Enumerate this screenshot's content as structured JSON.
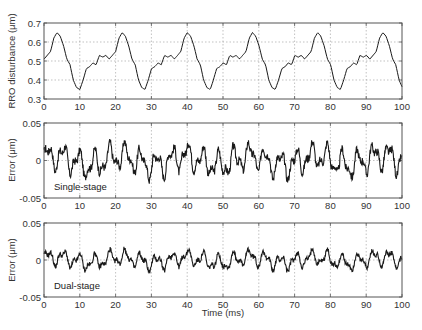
{
  "chart_data": [
    {
      "type": "line",
      "title": "",
      "xlabel": "",
      "ylabel": "RRO disturbance (μm)",
      "xlim": [
        0,
        100
      ],
      "ylim": [
        0.3,
        0.7
      ],
      "xticks": [
        "0",
        "10",
        "20",
        "30",
        "40",
        "50",
        "60",
        "70",
        "80",
        "90",
        "100"
      ],
      "yticks": [
        "0.3",
        "0.4",
        "0.5",
        "0.6",
        "0.7"
      ],
      "grid": true,
      "period_ms": 18.2,
      "series": [
        {
          "name": "RRO disturbance",
          "x": [
            0,
            1,
            2,
            3,
            4,
            5,
            6,
            7,
            8,
            9,
            10,
            11,
            12,
            13,
            14,
            15,
            16,
            17,
            18,
            19,
            20
          ],
          "values": [
            0.51,
            0.53,
            0.55,
            0.62,
            0.65,
            0.63,
            0.58,
            0.51,
            0.48,
            0.4,
            0.36,
            0.35,
            0.4,
            0.46,
            0.47,
            0.49,
            0.48,
            0.53,
            0.52,
            0.53,
            0.55
          ]
        }
      ]
    },
    {
      "type": "line",
      "title": "",
      "xlabel": "",
      "ylabel": "Error (μm)",
      "xlim": [
        0,
        100
      ],
      "ylim": [
        -0.05,
        0.05
      ],
      "xticks": [
        "0",
        "10",
        "20",
        "30",
        "40",
        "50",
        "60",
        "70",
        "80",
        "90",
        "100"
      ],
      "yticks": [
        "-0.05",
        "0",
        "0.05"
      ],
      "grid": true,
      "annotation": "Single-stage",
      "series": [
        {
          "name": "Single-stage error",
          "amplitude_approx": 0.025,
          "range": [
            -0.022,
            0.027
          ]
        }
      ]
    },
    {
      "type": "line",
      "title": "",
      "xlabel": "Time (ms)",
      "ylabel": "Error (μm)",
      "xlim": [
        0,
        100
      ],
      "ylim": [
        -0.05,
        0.05
      ],
      "xticks": [
        "0",
        "10",
        "20",
        "30",
        "40",
        "50",
        "60",
        "70",
        "80",
        "90",
        "100"
      ],
      "yticks": [
        "-0.05",
        "0",
        "0.05"
      ],
      "grid": true,
      "annotation": "Dual-stage",
      "series": [
        {
          "name": "Dual-stage error",
          "amplitude_approx": 0.015,
          "range": [
            -0.015,
            0.018
          ]
        }
      ]
    }
  ],
  "panels": {
    "p1": {
      "ylabel": "RRO disturbance (μm)",
      "yticks": [
        "0.3",
        "0.4",
        "0.5",
        "0.6",
        "0.7"
      ]
    },
    "p2": {
      "ylabel": "Error (μm)",
      "yticks": [
        "-0.05",
        "0",
        "0.05"
      ],
      "annotation": "Single-stage"
    },
    "p3": {
      "ylabel": "Error (μm)",
      "yticks": [
        "-0.05",
        "0",
        "0.05"
      ],
      "annotation": "Dual-stage"
    },
    "xticks": [
      "0",
      "10",
      "20",
      "30",
      "40",
      "50",
      "60",
      "70",
      "80",
      "90",
      "100"
    ],
    "xlabel": "Time (ms)"
  }
}
